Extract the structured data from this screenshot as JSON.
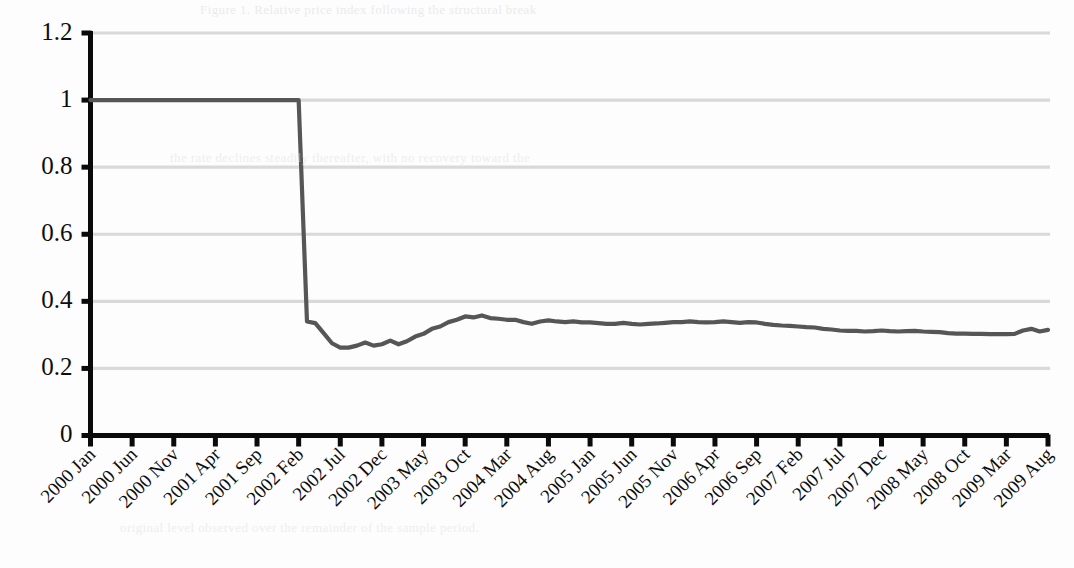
{
  "chart_data": {
    "type": "line",
    "title": "",
    "subtitle": "",
    "xlabel": "",
    "ylabel": "",
    "grid": true,
    "legend": false,
    "legend_position": "none",
    "line_color": "#565656",
    "gridline_color": "#d9d9d9",
    "axis_color": "#0a0a0a",
    "background_color": "#fdfdfd",
    "ylim": [
      0,
      1.2
    ],
    "ytick_labels": [
      "1.2",
      "1",
      "0.8",
      "0.6",
      "0.4",
      "0.2",
      "0"
    ],
    "ytick_values": [
      1.2,
      1,
      0.8,
      0.6,
      0.4,
      0.2,
      0
    ],
    "xtick_labels": [
      "2000 Jan",
      "2000 Jun",
      "2000 Nov",
      "2001 Apr",
      "2001 Sep",
      "2002 Feb",
      "2002 Jul",
      "2002 Dec",
      "2003 May",
      "2003 Oct",
      "2004 Mar",
      "2004 Aug",
      "2005 Jan",
      "2005 Jun",
      "2005 Nov",
      "2006 Apr",
      "2006 Sep",
      "2007 Feb",
      "2007 Jul",
      "2007 Dec",
      "2008 May",
      "2008 Oct",
      "2009 Mar",
      "2009 Aug"
    ],
    "xtick_interval_months": 5,
    "x_start": "2000 Jan",
    "x_end": "2009 Dec",
    "series": [
      {
        "name": "index",
        "color": "#565656",
        "values": [
          1.0,
          1.0,
          1.0,
          1.0,
          1.0,
          1.0,
          1.0,
          1.0,
          1.0,
          1.0,
          1.0,
          1.0,
          1.0,
          1.0,
          1.0,
          1.0,
          1.0,
          1.0,
          1.0,
          1.0,
          1.0,
          1.0,
          1.0,
          1.0,
          1.0,
          1.0,
          0.34,
          0.335,
          0.305,
          0.275,
          0.262,
          0.262,
          0.268,
          0.277,
          0.268,
          0.272,
          0.283,
          0.272,
          0.281,
          0.295,
          0.303,
          0.318,
          0.325,
          0.338,
          0.345,
          0.355,
          0.352,
          0.358,
          0.35,
          0.348,
          0.345,
          0.345,
          0.338,
          0.333,
          0.34,
          0.343,
          0.34,
          0.338,
          0.34,
          0.337,
          0.337,
          0.335,
          0.333,
          0.333,
          0.336,
          0.333,
          0.331,
          0.333,
          0.334,
          0.336,
          0.338,
          0.338,
          0.34,
          0.338,
          0.337,
          0.338,
          0.34,
          0.338,
          0.336,
          0.338,
          0.337,
          0.333,
          0.33,
          0.328,
          0.327,
          0.325,
          0.323,
          0.322,
          0.318,
          0.316,
          0.313,
          0.312,
          0.312,
          0.31,
          0.311,
          0.313,
          0.311,
          0.31,
          0.311,
          0.312,
          0.31,
          0.309,
          0.308,
          0.305,
          0.304,
          0.304,
          0.303,
          0.303,
          0.302,
          0.302,
          0.302,
          0.303,
          0.313,
          0.318,
          0.31,
          0.315,
          0.312,
          0.29,
          0.285,
          0.283,
          0.275,
          0.27,
          0.266,
          0.262,
          0.258,
          0.252,
          0.248,
          0.245,
          0.245,
          0.246,
          0.246
        ]
      }
    ],
    "annotations": []
  },
  "page_bleed": {
    "lines": [
      "Figure 1. Relative price index following the structural break",
      "the rate declines steadily thereafter, with no recovery toward the",
      "original level observed over the remainder of the sample period."
    ]
  }
}
